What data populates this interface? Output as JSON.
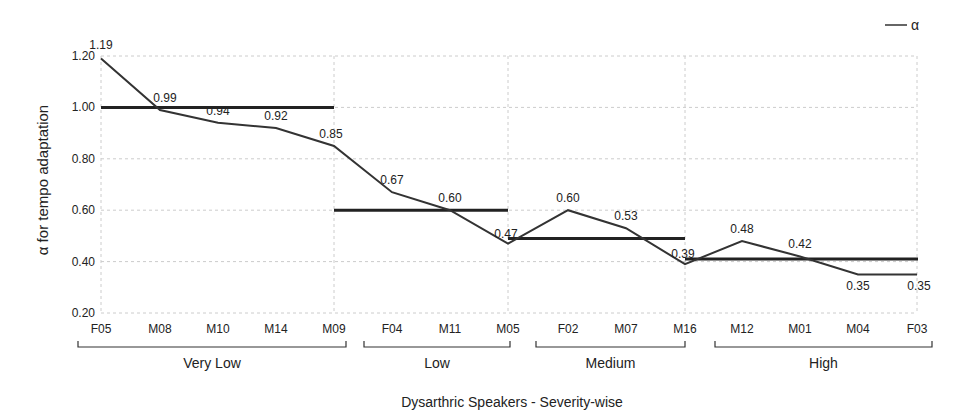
{
  "chart_data": {
    "type": "line",
    "title": "",
    "xlabel": "Dysarthric Speakers - Severity-wise",
    "ylabel": "α for tempo adaptation",
    "ylim": [
      0.2,
      1.2
    ],
    "yticks": [
      "0.20",
      "0.40",
      "0.60",
      "0.80",
      "1.00",
      "1.20"
    ],
    "grid": true,
    "legend": {
      "position": "top-right",
      "entries": [
        "α"
      ]
    },
    "categories": [
      "F05",
      "M08",
      "M10",
      "M14",
      "M09",
      "F04",
      "M11",
      "M05",
      "F02",
      "M07",
      "M16",
      "M12",
      "M01",
      "M04",
      "F03"
    ],
    "series": [
      {
        "name": "α",
        "values": [
          1.19,
          0.99,
          0.94,
          0.92,
          0.85,
          0.67,
          0.6,
          0.47,
          0.6,
          0.53,
          0.39,
          0.48,
          0.42,
          0.35,
          0.35
        ],
        "labels": [
          "1.19",
          "0.99",
          "0.94",
          "0.92",
          "0.85",
          "0.67",
          "0.60",
          "0.47",
          "0.60",
          "0.53",
          "0.39",
          "0.48",
          "0.42",
          "0.35",
          "0.35"
        ]
      }
    ],
    "groups": [
      {
        "name": "Very Low",
        "start": 0,
        "end": 4,
        "mean": 1.0
      },
      {
        "name": "Low",
        "start": 4,
        "end": 7,
        "mean": 0.6
      },
      {
        "name": "Medium",
        "start": 7,
        "end": 10,
        "mean": 0.49
      },
      {
        "name": "High",
        "start": 10,
        "end": 14,
        "mean": 0.41
      }
    ]
  }
}
